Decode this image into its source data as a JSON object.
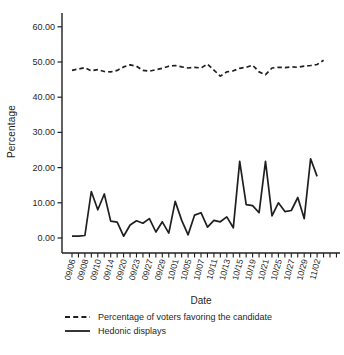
{
  "chart_data": {
    "type": "line",
    "title": "",
    "xlabel": "Date",
    "ylabel": "Percentage",
    "ylim": [
      0,
      60
    ],
    "grid": false,
    "legend_position": "bottom-left",
    "line_color": "#1f1f1f",
    "y_ticks": {
      "values": [
        60,
        50,
        40,
        30,
        20,
        10,
        0
      ],
      "labels": [
        "60.00",
        "50.00",
        "40.00",
        "30.00",
        "20.00",
        "10.00",
        "0.00"
      ]
    },
    "x_ticklabels": [
      "09/06",
      "09/08",
      "09/10",
      "09/14",
      "09/20",
      "09/23",
      "09/27",
      "09/29",
      "10/01",
      "10/05",
      "10/07",
      "10/11",
      "10/13",
      "10/15",
      "10/19",
      "10/21",
      "10/25",
      "10/27",
      "10/29",
      "11/02"
    ],
    "x_label_step": 2,
    "x_tick_count": 42,
    "series": [
      {
        "name": "Percentage of voters favoring the candidate",
        "style": "dashed",
        "values": [
          47.6,
          48.0,
          48.4,
          47.5,
          47.8,
          47.3,
          47.2,
          47.6,
          48.6,
          49.2,
          48.8,
          47.6,
          47.4,
          47.8,
          48.2,
          48.8,
          49.0,
          48.6,
          48.3,
          48.5,
          48.3,
          49.4,
          47.7,
          46.0,
          47.2,
          47.5,
          48.2,
          48.5,
          49.1,
          47.2,
          46.4,
          48.3,
          48.5,
          48.4,
          48.6,
          48.5,
          48.8,
          49.0,
          49.3,
          50.5
        ]
      },
      {
        "name": "Hedonic displays",
        "style": "solid",
        "values": [
          0.5,
          0.5,
          0.7,
          13.2,
          8.0,
          12.5,
          4.8,
          4.5,
          0.5,
          3.7,
          4.9,
          4.2,
          5.5,
          1.7,
          4.6,
          1.4,
          10.4,
          5.0,
          0.9,
          6.5,
          7.2,
          3.1,
          5.0,
          4.6,
          6.0,
          2.9,
          21.8,
          9.5,
          9.2,
          7.2,
          21.8,
          6.3,
          10.0,
          7.5,
          7.8,
          11.5,
          5.5,
          22.5,
          17.5
        ]
      }
    ]
  }
}
